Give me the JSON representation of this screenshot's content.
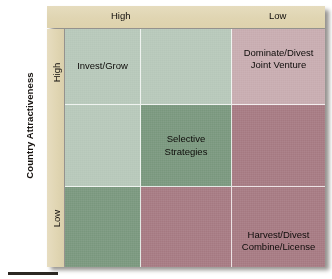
{
  "chart_data": {
    "type": "heatmap",
    "title": "",
    "xlabel": "",
    "ylabel": "Country Attractiveness",
    "x_tick_labels": [
      "High",
      "Low"
    ],
    "y_tick_labels": [
      "High",
      "Low"
    ],
    "grid": true,
    "legend": "none",
    "columns": 3,
    "rows": 3,
    "palette": {
      "light_green": "#b8c9bb",
      "medium_green": "#7d9a81",
      "light_rose": "#c9aeb2",
      "dark_rose": "#a87d85",
      "band_beige": "#e0d5b2",
      "text_dark": "#0d0b09",
      "divider_white": "#ffffff"
    },
    "cells": [
      {
        "row": 0,
        "col": 0,
        "label": "Invest/Grow",
        "color": "#b8c9bb",
        "align": "middle"
      },
      {
        "row": 0,
        "col": 1,
        "label": "",
        "color": "#b8c9bb",
        "align": "middle"
      },
      {
        "row": 0,
        "col": 2,
        "label": "Dominate/Divest\nJoint Venture",
        "color": "#c9aeb2",
        "align": "top"
      },
      {
        "row": 1,
        "col": 0,
        "label": "",
        "color": "#b8c9bb",
        "align": "middle"
      },
      {
        "row": 1,
        "col": 1,
        "label": "Selective\nStrategies",
        "color": "#7d9a81",
        "align": "middle"
      },
      {
        "row": 1,
        "col": 2,
        "label": "",
        "color": "#a87d85",
        "align": "middle"
      },
      {
        "row": 2,
        "col": 0,
        "label": "",
        "color": "#7d9a81",
        "align": "middle"
      },
      {
        "row": 2,
        "col": 1,
        "label": "",
        "color": "#a87d85",
        "align": "middle"
      },
      {
        "row": 2,
        "col": 2,
        "label": "Harvest/Divest\nCombine/License",
        "color": "#a87d85",
        "align": "bottom"
      }
    ]
  },
  "axes": {
    "y_title": "Country Attractiveness",
    "x_high": "High",
    "x_low": "Low",
    "y_high": "High",
    "y_low": "Low"
  }
}
